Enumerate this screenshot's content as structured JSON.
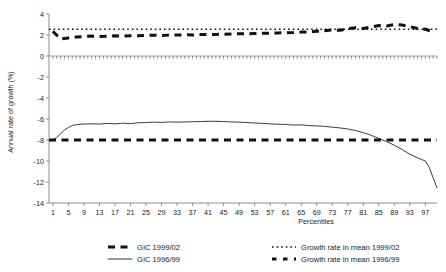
{
  "chart_data": {
    "type": "line",
    "title": "",
    "xlabel": "Percentiles",
    "ylabel": "Annual rate of growth (%)",
    "xlim": [
      0,
      100
    ],
    "ylim": [
      -14,
      4
    ],
    "ytick_labels": [
      "4",
      "2",
      "0",
      "-2",
      "-4",
      "-6",
      "-8",
      "-10",
      "-12",
      "-14"
    ],
    "ytick_values": [
      4,
      2,
      0,
      -2,
      -4,
      -6,
      -8,
      -10,
      -12,
      -14
    ],
    "xtick_labels": [
      "1",
      "5",
      "9",
      "13",
      "17",
      "21",
      "25",
      "29",
      "33",
      "37",
      "41",
      "45",
      "49",
      "53",
      "57",
      "61",
      "65",
      "69",
      "73",
      "77",
      "81",
      "85",
      "89",
      "93",
      "97"
    ],
    "xtick_values": [
      1,
      5,
      9,
      13,
      17,
      21,
      25,
      29,
      33,
      37,
      41,
      45,
      49,
      53,
      57,
      61,
      65,
      69,
      73,
      77,
      81,
      85,
      89,
      93,
      97
    ],
    "minor_xtick_step": 1,
    "grid": false,
    "legend_position": "below",
    "zero_line": 0,
    "series": [
      {
        "name": "GIC 1999/02",
        "style": "thick-dashed",
        "color": "#111111",
        "x": [
          1,
          3,
          5,
          7,
          9,
          11,
          13,
          15,
          17,
          19,
          21,
          23,
          25,
          27,
          29,
          31,
          33,
          35,
          37,
          39,
          41,
          43,
          45,
          47,
          49,
          51,
          53,
          55,
          57,
          59,
          61,
          63,
          65,
          67,
          69,
          71,
          73,
          75,
          77,
          79,
          81,
          83,
          85,
          87,
          89,
          91,
          93,
          95,
          97,
          99
        ],
        "values": [
          2.35,
          1.62,
          1.72,
          1.8,
          1.86,
          1.9,
          1.86,
          1.88,
          1.92,
          1.9,
          1.94,
          1.92,
          1.96,
          1.98,
          1.95,
          1.99,
          2.0,
          2.02,
          2.0,
          2.04,
          2.06,
          2.05,
          2.08,
          2.1,
          2.12,
          2.1,
          2.14,
          2.16,
          2.18,
          2.2,
          2.22,
          2.24,
          2.28,
          2.3,
          2.35,
          2.4,
          2.48,
          2.45,
          2.6,
          2.7,
          2.62,
          2.75,
          2.9,
          2.85,
          3.0,
          2.95,
          2.8,
          2.62,
          2.55,
          2.3
        ]
      },
      {
        "name": "GIC 1996/99",
        "style": "thin-solid",
        "color": "#1a1a1a",
        "x": [
          1,
          2,
          3,
          4,
          5,
          6,
          7,
          8,
          9,
          11,
          13,
          15,
          17,
          19,
          21,
          23,
          25,
          27,
          29,
          31,
          33,
          35,
          37,
          39,
          41,
          43,
          45,
          47,
          49,
          51,
          53,
          55,
          57,
          59,
          61,
          63,
          65,
          67,
          69,
          71,
          73,
          75,
          77,
          79,
          81,
          83,
          85,
          87,
          89,
          91,
          93,
          95,
          96,
          97,
          98,
          99,
          100
        ],
        "values": [
          -8.0,
          -7.75,
          -7.4,
          -7.05,
          -6.8,
          -6.62,
          -6.55,
          -6.5,
          -6.48,
          -6.46,
          -6.48,
          -6.42,
          -6.46,
          -6.4,
          -6.44,
          -6.36,
          -6.34,
          -6.3,
          -6.32,
          -6.28,
          -6.3,
          -6.28,
          -6.26,
          -6.24,
          -6.22,
          -6.22,
          -6.24,
          -6.28,
          -6.3,
          -6.34,
          -6.38,
          -6.42,
          -6.46,
          -6.5,
          -6.52,
          -6.58,
          -6.56,
          -6.62,
          -6.66,
          -6.7,
          -6.78,
          -6.85,
          -6.95,
          -7.1,
          -7.3,
          -7.55,
          -7.85,
          -8.15,
          -8.5,
          -8.9,
          -9.35,
          -9.7,
          -9.85,
          -10.0,
          -10.6,
          -11.6,
          -12.55
        ]
      },
      {
        "name": "Growth rate in mean 1999/02",
        "style": "fine-dotted",
        "color": "#111111",
        "constant": 2.55
      },
      {
        "name": "Growth rate in mean 1996/99",
        "style": "thick-dashed",
        "color": "#111111",
        "constant": -8.0
      }
    ]
  },
  "legend": {
    "entries": [
      {
        "label": "GIC 1999/02",
        "style": "thick-dashed"
      },
      {
        "label": "GIC 1996/99",
        "style": "thin-solid"
      },
      {
        "label": "Growth rate in mean 1999/02",
        "style": "fine-dotted"
      },
      {
        "label": "Growth rate in mean 1996/99",
        "style": "thick-dotted"
      }
    ]
  }
}
